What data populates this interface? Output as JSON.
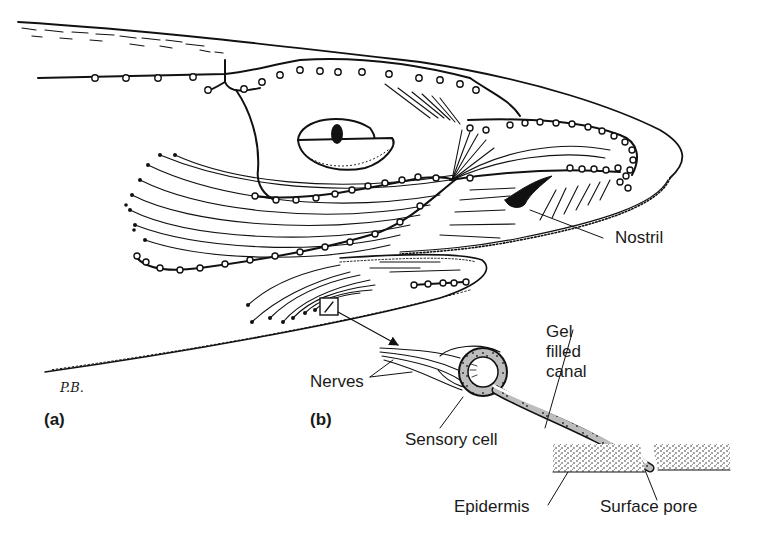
{
  "figure": {
    "signature": "P.B.",
    "panels": {
      "a": "(a)",
      "b": "(b)"
    },
    "labels": {
      "nostril": "Nostril",
      "nerves": "Nerves",
      "gel_filled_canal": [
        "Gel",
        "filled",
        "canal"
      ],
      "sensory_cell": "Sensory cell",
      "epidermis": "Epidermis",
      "surface_pore": "Surface pore"
    },
    "colors": {
      "ink": "#111111",
      "background": "#ffffff",
      "stipple": "#555555"
    }
  }
}
